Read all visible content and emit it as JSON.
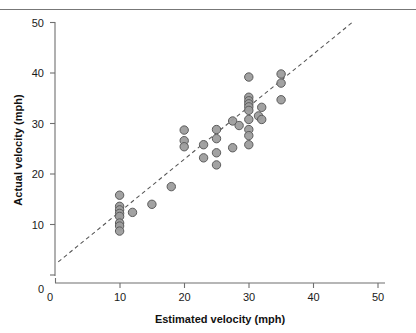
{
  "figure": {
    "background_color": "#ffffff",
    "top_rule_color": "#777777"
  },
  "chart_data": {
    "type": "scatter",
    "title": "",
    "subtitle": "",
    "xlabel": "Estimated velocity (mph)",
    "ylabel": "Actual velocity (mph)",
    "xlim": [
      0,
      50
    ],
    "ylim": [
      0,
      50
    ],
    "xticks": [
      0,
      10,
      20,
      30,
      40,
      50
    ],
    "yticks": [
      0,
      10,
      20,
      30,
      40,
      50
    ],
    "xtick_labels": [
      "0",
      "10",
      "20",
      "30",
      "40",
      "50"
    ],
    "ytick_labels": [
      "0",
      "10",
      "20",
      "30",
      "40",
      "50"
    ],
    "grid": false,
    "legend": false,
    "legend_position": "none",
    "marker": {
      "shape": "circle",
      "radius_px": 4.2,
      "fill_color": "#9d9d9d",
      "edge_color": "#5b5b5b"
    },
    "reference_line": {
      "style": "dashed",
      "color": "#555555",
      "label": "",
      "x_start": 0.5,
      "y_start": 2.6,
      "x_end": 46.0,
      "y_end": 50.0
    },
    "points": [
      {
        "x": 10,
        "y": 15.8
      },
      {
        "x": 10,
        "y": 13.6
      },
      {
        "x": 10,
        "y": 12.9
      },
      {
        "x": 10,
        "y": 12.2
      },
      {
        "x": 10,
        "y": 11.6
      },
      {
        "x": 10,
        "y": 10.3
      },
      {
        "x": 10,
        "y": 9.7
      },
      {
        "x": 10,
        "y": 8.7
      },
      {
        "x": 12,
        "y": 12.4
      },
      {
        "x": 15,
        "y": 14.0
      },
      {
        "x": 18,
        "y": 17.5
      },
      {
        "x": 20,
        "y": 28.7
      },
      {
        "x": 20,
        "y": 26.6
      },
      {
        "x": 20,
        "y": 25.4
      },
      {
        "x": 23,
        "y": 25.8
      },
      {
        "x": 23,
        "y": 23.2
      },
      {
        "x": 25,
        "y": 28.8
      },
      {
        "x": 25,
        "y": 27.0
      },
      {
        "x": 25,
        "y": 24.2
      },
      {
        "x": 25,
        "y": 21.8
      },
      {
        "x": 27.5,
        "y": 30.5
      },
      {
        "x": 27.5,
        "y": 25.2
      },
      {
        "x": 28.5,
        "y": 29.6
      },
      {
        "x": 30,
        "y": 39.2
      },
      {
        "x": 30,
        "y": 35.2
      },
      {
        "x": 30,
        "y": 34.5
      },
      {
        "x": 30,
        "y": 33.9
      },
      {
        "x": 30,
        "y": 33.3
      },
      {
        "x": 30,
        "y": 32.6
      },
      {
        "x": 30,
        "y": 30.8
      },
      {
        "x": 30,
        "y": 28.8
      },
      {
        "x": 30,
        "y": 27.6
      },
      {
        "x": 30,
        "y": 25.8
      },
      {
        "x": 31.5,
        "y": 31.5
      },
      {
        "x": 32,
        "y": 33.2
      },
      {
        "x": 32,
        "y": 30.8
      },
      {
        "x": 35,
        "y": 39.8
      },
      {
        "x": 35,
        "y": 38.0
      },
      {
        "x": 35,
        "y": 34.7
      }
    ]
  }
}
